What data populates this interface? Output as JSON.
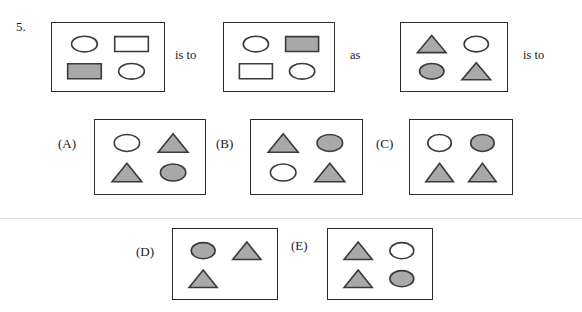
{
  "question": {
    "number": "5.",
    "connector_1": "is to",
    "connector_2": "as",
    "connector_3": "is to"
  },
  "colors": {
    "shaded": "#a9a9a9",
    "outline": "#3a3a3a",
    "unshaded": "#ffffff",
    "panel_border": "#2b2b2b",
    "text": "#1a1a1a"
  },
  "prompt_panels": [
    {
      "id": "prompt-panel-1",
      "shapes": [
        {
          "slot": "top-left",
          "shape": "circle",
          "fill": "unshaded"
        },
        {
          "slot": "top-right",
          "shape": "rectangle",
          "fill": "unshaded"
        },
        {
          "slot": "bottom-left",
          "shape": "rectangle",
          "fill": "shaded"
        },
        {
          "slot": "bottom-right",
          "shape": "circle",
          "fill": "unshaded"
        }
      ]
    },
    {
      "id": "prompt-panel-2",
      "shapes": [
        {
          "slot": "top-left",
          "shape": "circle",
          "fill": "unshaded"
        },
        {
          "slot": "top-right",
          "shape": "rectangle",
          "fill": "shaded"
        },
        {
          "slot": "bottom-left",
          "shape": "rectangle",
          "fill": "unshaded"
        },
        {
          "slot": "bottom-right",
          "shape": "circle",
          "fill": "unshaded"
        }
      ]
    },
    {
      "id": "prompt-panel-3",
      "shapes": [
        {
          "slot": "top-left",
          "shape": "triangle",
          "fill": "shaded"
        },
        {
          "slot": "top-right",
          "shape": "circle",
          "fill": "unshaded"
        },
        {
          "slot": "bottom-left",
          "shape": "circle",
          "fill": "shaded"
        },
        {
          "slot": "bottom-right",
          "shape": "triangle",
          "fill": "shaded"
        }
      ]
    }
  ],
  "options": [
    {
      "id": "option-a",
      "label": "(A)",
      "shapes": [
        {
          "slot": "top-left",
          "shape": "circle",
          "fill": "unshaded"
        },
        {
          "slot": "top-right",
          "shape": "triangle",
          "fill": "shaded"
        },
        {
          "slot": "bottom-left",
          "shape": "triangle",
          "fill": "shaded"
        },
        {
          "slot": "bottom-right",
          "shape": "circle",
          "fill": "shaded"
        }
      ]
    },
    {
      "id": "option-b",
      "label": "(B)",
      "shapes": [
        {
          "slot": "top-left",
          "shape": "triangle",
          "fill": "shaded"
        },
        {
          "slot": "top-right",
          "shape": "circle",
          "fill": "shaded"
        },
        {
          "slot": "bottom-left",
          "shape": "circle",
          "fill": "unshaded"
        },
        {
          "slot": "bottom-right",
          "shape": "triangle",
          "fill": "shaded"
        }
      ]
    },
    {
      "id": "option-c",
      "label": "(C)",
      "shapes": [
        {
          "slot": "top-left",
          "shape": "circle",
          "fill": "unshaded"
        },
        {
          "slot": "top-right",
          "shape": "circle",
          "fill": "shaded"
        },
        {
          "slot": "bottom-left",
          "shape": "triangle",
          "fill": "shaded"
        },
        {
          "slot": "bottom-right",
          "shape": "triangle",
          "fill": "shaded"
        }
      ]
    },
    {
      "id": "option-d",
      "label": "(D)",
      "shapes": [
        {
          "slot": "top-left",
          "shape": "circle",
          "fill": "shaded"
        },
        {
          "slot": "top-right",
          "shape": "triangle",
          "fill": "shaded"
        },
        {
          "slot": "bottom-left",
          "shape": "triangle",
          "fill": "shaded"
        },
        {
          "slot": "bottom-right",
          "shape": "none",
          "fill": "none"
        }
      ]
    },
    {
      "id": "option-e",
      "label": "(E)",
      "shapes": [
        {
          "slot": "top-left",
          "shape": "triangle",
          "fill": "shaded"
        },
        {
          "slot": "top-right",
          "shape": "circle",
          "fill": "unshaded"
        },
        {
          "slot": "bottom-left",
          "shape": "triangle",
          "fill": "shaded"
        },
        {
          "slot": "bottom-right",
          "shape": "circle",
          "fill": "shaded"
        }
      ]
    }
  ]
}
